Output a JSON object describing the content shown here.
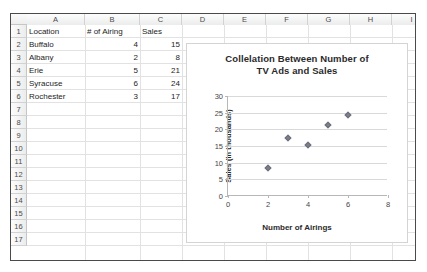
{
  "sheet": {
    "columns": [
      "A",
      "B",
      "C",
      "D",
      "E",
      "F",
      "G",
      "H",
      "I"
    ],
    "rows": [
      "1",
      "2",
      "3",
      "4",
      "5",
      "6",
      "7",
      "8",
      "9",
      "10",
      "11",
      "12",
      "13",
      "14",
      "15",
      "16",
      "17"
    ],
    "headers": {
      "location": "Location",
      "airings": "# of Airing",
      "sales": "Sales"
    },
    "data": [
      {
        "location": "Buffalo",
        "airings": "4",
        "sales": "15"
      },
      {
        "location": "Albany",
        "airings": "2",
        "sales": "8"
      },
      {
        "location": "Erie",
        "airings": "5",
        "sales": "21"
      },
      {
        "location": "Syracuse",
        "airings": "6",
        "sales": "24"
      },
      {
        "location": "Rochester",
        "airings": "3",
        "sales": "17"
      }
    ]
  },
  "chart_data": {
    "type": "scatter",
    "title": "Collelation Between Number of TV Ads and Sales",
    "title_line1": "Collelation Between Number of",
    "title_line2": "TV Ads and Sales",
    "xlabel": "Number of Airings",
    "ylabel": "Sales (in thousands)",
    "xlim": [
      0,
      8
    ],
    "ylim": [
      0,
      30
    ],
    "xticks": [
      "0",
      "2",
      "4",
      "6",
      "8"
    ],
    "yticks": [
      "0",
      "5",
      "10",
      "15",
      "20",
      "25",
      "30"
    ],
    "grid": "horizontal",
    "legend": "none",
    "marker_color": "#7b7f8c",
    "points": [
      {
        "label": "Albany",
        "x": 2,
        "y": 8
      },
      {
        "label": "Rochester",
        "x": 3,
        "y": 17
      },
      {
        "label": "Buffalo",
        "x": 4,
        "y": 15
      },
      {
        "label": "Erie",
        "x": 5,
        "y": 21
      },
      {
        "label": "Syracuse",
        "x": 6,
        "y": 24
      }
    ]
  }
}
